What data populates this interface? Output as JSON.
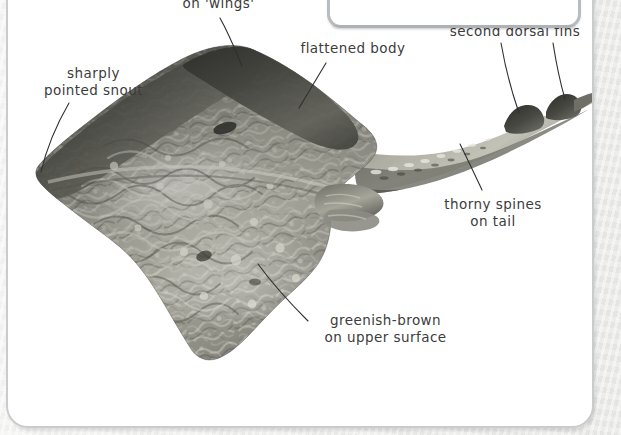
{
  "page": {
    "background_color": "#f1f1ef",
    "panel_color": "#ffffff",
    "panel_border_color": "#c9cccd",
    "tab_border_color": "#b9bcbe"
  },
  "figure": {
    "body_color_dark": "#4a4a46",
    "body_color_mid": "#8d8d85",
    "body_color_light": "#c4c4bb",
    "tail_color": "#9b9b92"
  },
  "annotations": [
    {
      "id": "sharp-corners",
      "line1": "sharp corners",
      "line2": "on 'wings'"
    },
    {
      "id": "pointed-snout",
      "line1": "sharply",
      "line2": "pointed snout"
    },
    {
      "id": "flattened-body",
      "line1": "flattened body",
      "line2": ""
    },
    {
      "id": "dorsal-fins",
      "line1": "small first and",
      "line2": "second dorsal fins"
    },
    {
      "id": "thorny-spines",
      "line1": "thorny spines",
      "line2": "on tail"
    },
    {
      "id": "greenish-brown",
      "line1": "greenish-brown",
      "line2": "on upper surface"
    }
  ]
}
